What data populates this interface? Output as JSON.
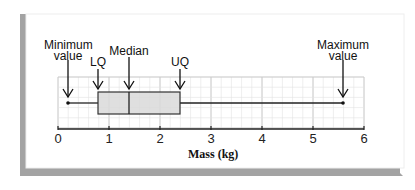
{
  "chart_data": {
    "type": "boxplot",
    "title": "",
    "xlabel": "Mass (kg)",
    "ylabel": "",
    "xlim": [
      0,
      6
    ],
    "x_ticks": [
      "0",
      "1",
      "2",
      "3",
      "4",
      "5",
      "6"
    ],
    "grid": true,
    "values": {
      "minimum": 0.2,
      "lower_quartile": 0.8,
      "median": 1.4,
      "upper_quartile": 2.4,
      "maximum": 5.6
    },
    "annotations": [
      {
        "text": "Minimum value",
        "x": 0.2
      },
      {
        "text": "LQ",
        "x": 0.8
      },
      {
        "text": "Median",
        "x": 1.4
      },
      {
        "text": "UQ",
        "x": 2.4
      },
      {
        "text": "Maximum value",
        "x": 5.6
      }
    ]
  },
  "labels": {
    "min_line1": "Minimum",
    "min_line2": "value",
    "lq": "LQ",
    "median": "Median",
    "uq": "UQ",
    "max_line1": "Maximum",
    "max_line2": "value",
    "xlabel": "Mass (kg)"
  },
  "ticks": [
    "0",
    "1",
    "2",
    "3",
    "4",
    "5",
    "6"
  ],
  "colors": {
    "box_fill": "#d9d9d9",
    "grid_minor": "#e3e3e3",
    "grid_major": "#c4c4c4",
    "frame_shadow": "#9a9a9a",
    "line": "#222222"
  }
}
